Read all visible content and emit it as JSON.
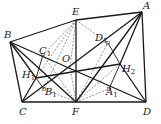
{
  "diagram": {
    "type": "geometry",
    "points": {
      "A": {
        "label": "A",
        "sub": "",
        "x": 142,
        "y": 12,
        "lx": 143,
        "ly": 9
      },
      "B": {
        "label": "B",
        "sub": "",
        "x": 10,
        "y": 42,
        "lx": 4,
        "ly": 38
      },
      "C": {
        "label": "C",
        "sub": "",
        "x": 22,
        "y": 102,
        "lx": 19,
        "ly": 115
      },
      "D": {
        "label": "D",
        "sub": "",
        "x": 146,
        "y": 102,
        "lx": 143,
        "ly": 115
      },
      "E": {
        "label": "E",
        "sub": "",
        "x": 76,
        "y": 20,
        "lx": 72,
        "ly": 15
      },
      "F": {
        "label": "F",
        "sub": "",
        "x": 76,
        "y": 102,
        "lx": 72,
        "ly": 115
      },
      "O": {
        "label": "O",
        "sub": "",
        "x": 70,
        "y": 67,
        "lx": 62,
        "ly": 62
      },
      "H1": {
        "label": "H",
        "sub": "1",
        "x": 36,
        "y": 78,
        "lx": 22,
        "ly": 78
      },
      "H2": {
        "label": "H",
        "sub": "2",
        "x": 120,
        "y": 64,
        "lx": 122,
        "ly": 72
      },
      "C1": {
        "label": "C",
        "sub": "1",
        "x": 43,
        "y": 55,
        "lx": 39,
        "ly": 54
      },
      "D1": {
        "label": "D",
        "sub": "1",
        "x": 108,
        "y": 43,
        "lx": 95,
        "ly": 41
      },
      "B1": {
        "label": "B",
        "sub": "1",
        "x": 44,
        "y": 89,
        "lx": 45,
        "ly": 95
      },
      "A1": {
        "label": "A",
        "sub": "1",
        "x": 109,
        "y": 89,
        "lx": 106,
        "ly": 95
      }
    },
    "solid_segments": [
      [
        "B",
        "E"
      ],
      [
        "E",
        "A"
      ],
      [
        "B",
        "C"
      ],
      [
        "C",
        "D"
      ],
      [
        "A",
        "D"
      ],
      [
        "E",
        "F"
      ],
      [
        "B",
        "D"
      ],
      [
        "C",
        "A"
      ],
      [
        "B",
        "F"
      ],
      [
        "F",
        "A"
      ],
      [
        "H1",
        "C"
      ],
      [
        "H1",
        "H2"
      ],
      [
        "H2",
        "D"
      ],
      [
        "H2",
        "A"
      ],
      [
        "H1",
        "B"
      ]
    ],
    "thin_segments": [
      [
        "C1",
        "H1"
      ],
      [
        "H1",
        "B1"
      ],
      [
        "D1",
        "H2"
      ],
      [
        "H2",
        "A1"
      ]
    ],
    "dashed_segments": [
      [
        "E",
        "C1"
      ],
      [
        "E",
        "B1"
      ],
      [
        "E",
        "O"
      ],
      [
        "E",
        "H1"
      ],
      [
        "F",
        "C1"
      ],
      [
        "F",
        "B1"
      ],
      [
        "E",
        "D1"
      ],
      [
        "F",
        "D1"
      ],
      [
        "F",
        "A1"
      ],
      [
        "F",
        "H2"
      ],
      [
        "O",
        "F"
      ]
    ],
    "right_angle_marks": [
      "C1",
      "D1",
      "B1",
      "A1"
    ]
  }
}
